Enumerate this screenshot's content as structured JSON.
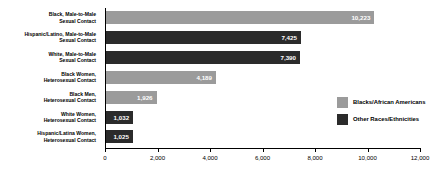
{
  "chart_data": {
    "type": "bar",
    "orientation": "horizontal",
    "title": "",
    "subtitle": "",
    "xlabel": "",
    "ylabel": "",
    "xlim": [
      0,
      12000
    ],
    "grid": false,
    "legend_position": "right",
    "tick_labels": [
      "0",
      "2,000",
      "4,000",
      "6,000",
      "8,000",
      "10,000",
      "12,000"
    ],
    "tick_values": [
      0,
      2000,
      4000,
      6000,
      8000,
      10000,
      12000
    ],
    "categories": [
      "Black, Male-to-Male Sexual Contact",
      "Hispanic/Latino, Male-to-Male Sexual Contact",
      "White, Male-to-Male Sexual Contact",
      "Black Women, Heterosexual Contact",
      "Black Men, Heterosexual Contact",
      "White Women, Heterosexual Contact",
      "Hispanic/Latina Women, Heterosexual Contact"
    ],
    "values": [
      10223,
      7425,
      7390,
      4189,
      1926,
      1032,
      1025
    ],
    "value_labels": [
      "10,223",
      "7,425",
      "7,390",
      "4,189",
      "1,926",
      "1,032",
      "1,025"
    ],
    "series": [
      {
        "name": "Blacks/African Americans",
        "color": "#9b9b9b"
      },
      {
        "name": "Other Races/Ethnicities",
        "color": "#2b2b2b"
      }
    ],
    "bar_group": [
      "Blacks/African Americans",
      "Other Races/Ethnicities",
      "Other Races/Ethnicities",
      "Blacks/African Americans",
      "Blacks/African Americans",
      "Other Races/Ethnicities",
      "Other Races/Ethnicities"
    ]
  },
  "rows": [
    {
      "label_line1": "Black, Male-to-Male",
      "label_line2": "Sexual Contact",
      "value": 10223,
      "value_label": "10,223",
      "group": "light"
    },
    {
      "label_line1": "Hispanic/Latino, Male-to-Male",
      "label_line2": "Sexual Contact",
      "value": 7425,
      "value_label": "7,425",
      "group": "dark"
    },
    {
      "label_line1": "White, Male-to-Male",
      "label_line2": "Sexual Contact",
      "value": 7390,
      "value_label": "7,390",
      "group": "dark"
    },
    {
      "label_line1": "Black Women,",
      "label_line2": "Heterosexual Contact",
      "value": 4189,
      "value_label": "4,189",
      "group": "light"
    },
    {
      "label_line1": "Black Men,",
      "label_line2": "Heterosexual Contact",
      "value": 1926,
      "value_label": "1,926",
      "group": "light"
    },
    {
      "label_line1": "White Women,",
      "label_line2": "Heterosexual Contact",
      "value": 1032,
      "value_label": "1,032",
      "group": "dark"
    },
    {
      "label_line1": "Hispanic/Latina Women,",
      "label_line2": "Heterosexual Contact",
      "value": 1025,
      "value_label": "1,025",
      "group": "dark"
    }
  ],
  "axis": {
    "ticks": [
      {
        "label": "0",
        "value": 0
      },
      {
        "label": "2,000",
        "value": 2000
      },
      {
        "label": "4,000",
        "value": 4000
      },
      {
        "label": "6,000",
        "value": 6000
      },
      {
        "label": "8,000",
        "value": 8000
      },
      {
        "label": "10,000",
        "value": 10000
      },
      {
        "label": "12,000",
        "value": 12000
      }
    ]
  },
  "legend": {
    "items": [
      {
        "label": "Blacks/African Americans",
        "swatch": "light",
        "color": "#9b9b9b"
      },
      {
        "label": "Other Races/Ethnicities",
        "swatch": "dark",
        "color": "#2b2b2b"
      }
    ]
  }
}
